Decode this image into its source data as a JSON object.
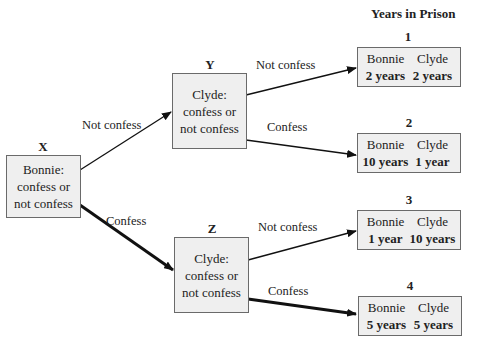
{
  "header": {
    "title": "Years in Prison"
  },
  "nodes": {
    "x": {
      "label": "X",
      "line1": "Bonnie:",
      "line2": "confess or",
      "line3": "not confess"
    },
    "y": {
      "label": "Y",
      "line1": "Clyde:",
      "line2": "confess or",
      "line3": "not confess"
    },
    "z": {
      "label": "Z",
      "line1": "Clyde:",
      "line2": "confess or",
      "line3": "not confess"
    }
  },
  "edges": {
    "x_y": "Not confess",
    "x_z": "Confess",
    "y_1": "Not confess",
    "y_2": "Confess",
    "z_3": "Not confess",
    "z_4": "Confess"
  },
  "outcomes": [
    {
      "num": "1",
      "p1": "Bonnie",
      "p2": "Clyde",
      "v1": "2 years",
      "v2": "2 years"
    },
    {
      "num": "2",
      "p1": "Bonnie",
      "p2": "Clyde",
      "v1": "10 years",
      "v2": "1 year"
    },
    {
      "num": "3",
      "p1": "Bonnie",
      "p2": "Clyde",
      "v1": "1 year",
      "v2": "10 years"
    },
    {
      "num": "4",
      "p1": "Bonnie",
      "p2": "Clyde",
      "v1": "5 years",
      "v2": "5 years"
    }
  ],
  "colors": {
    "box_fill": "#efefef",
    "box_border": "#6a6a6a",
    "line": "#111111"
  }
}
